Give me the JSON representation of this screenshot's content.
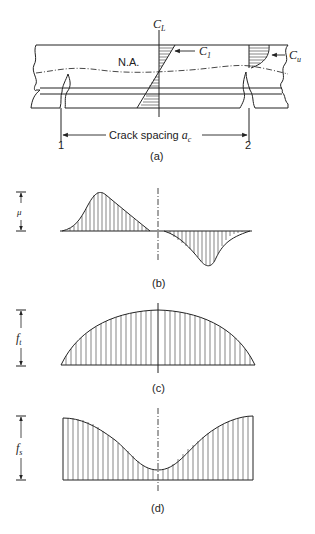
{
  "figure": {
    "panel_a": {
      "label": "(a)",
      "centerline_label": "C",
      "centerline_sub": "L",
      "c1_label": "C",
      "c1_sub": "1",
      "cu_label": "C",
      "cu_sub": "u",
      "neutral_axis_label": "N.A.",
      "crack_spacing_label": "Crack spacing ",
      "crack_spacing_symbol": "a",
      "crack_spacing_sub": "c",
      "crack_1_label": "1",
      "crack_2_label": "2"
    },
    "panel_b": {
      "label": "(b)",
      "dimension_symbol": "μ",
      "description": "Bond stress distribution"
    },
    "panel_c": {
      "label": "(c)",
      "dimension_symbol": "f",
      "dimension_sub": "t",
      "description": "Concrete tensile stress distribution"
    },
    "panel_d": {
      "label": "(d)",
      "dimension_symbol": "f",
      "dimension_sub": "s",
      "description": "Steel stress distribution"
    }
  }
}
